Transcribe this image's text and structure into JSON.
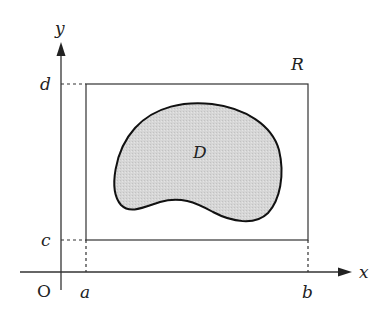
{
  "diagram": {
    "type": "region-in-rectangle",
    "axes": {
      "x_label": "x",
      "y_label": "y",
      "origin_label": "O"
    },
    "ticks": {
      "x": [
        "a",
        "b"
      ],
      "y": [
        "c",
        "d"
      ]
    },
    "rectangle": {
      "label": "R"
    },
    "region": {
      "label": "D",
      "fill": "#d4d4d4",
      "stroke": "#111111"
    },
    "colors": {
      "line": "#333333",
      "background": "#ffffff"
    }
  }
}
